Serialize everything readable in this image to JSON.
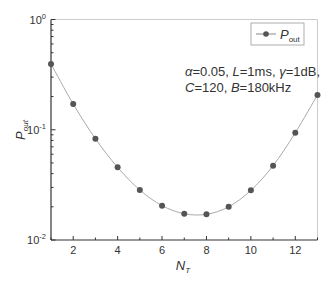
{
  "chart_data": {
    "type": "line",
    "title": "",
    "xlabel": "N_T",
    "xlabel_main": "N",
    "xlabel_sub": "T",
    "ylabel": "P_out",
    "ylabel_main": "P",
    "ylabel_sub": "out",
    "yscale": "log",
    "xlim": [
      1,
      13
    ],
    "ylim": [
      0.01,
      1
    ],
    "x_ticks": [
      2,
      4,
      6,
      8,
      10,
      12
    ],
    "x_tick_labels": [
      "2",
      "4",
      "6",
      "8",
      "10",
      "12"
    ],
    "y_ticks": [
      0.01,
      0.1,
      1
    ],
    "y_tick_labels": [
      {
        "base": "10",
        "exp": "-2"
      },
      {
        "base": "10",
        "exp": "-1"
      },
      {
        "base": "10",
        "exp": "0"
      }
    ],
    "grid": false,
    "legend_position": "upper right",
    "series": [
      {
        "name": "P_out",
        "legend_main": "P",
        "legend_sub": "out",
        "marker": "circle",
        "color": "#555555",
        "line_color": "#aaaaaa",
        "x": [
          1,
          2,
          3,
          4,
          5,
          6,
          7,
          8,
          9,
          10,
          11,
          12,
          13
        ],
        "values": [
          0.395,
          0.171,
          0.083,
          0.0456,
          0.0284,
          0.0205,
          0.0173,
          0.0171,
          0.02,
          0.0282,
          0.0472,
          0.094,
          0.207
        ]
      }
    ],
    "annotations": [
      {
        "line1": [
          {
            "text": "α",
            "italic": true
          },
          {
            "text": "=0.05, ",
            "italic": false
          },
          {
            "text": "L",
            "italic": true
          },
          {
            "text": "=1ms, ",
            "italic": false
          },
          {
            "text": "γ",
            "italic": true
          },
          {
            "text": "=1dB,",
            "italic": false
          }
        ],
        "line2": [
          {
            "text": "C",
            "italic": true
          },
          {
            "text": "=120, ",
            "italic": false
          },
          {
            "text": "B",
            "italic": true
          },
          {
            "text": "=180kHz",
            "italic": false
          }
        ]
      }
    ]
  }
}
